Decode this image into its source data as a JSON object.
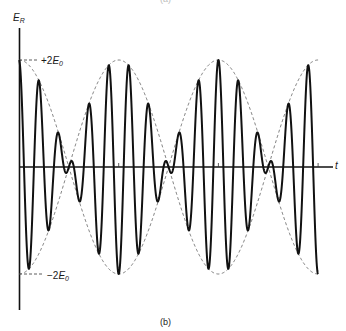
{
  "figure": {
    "top_caption": "(a)",
    "caption": "(b)",
    "y_axis_label": {
      "symbol": "E",
      "subscript": "R"
    },
    "x_axis_label": "t",
    "upper_level_label": {
      "prefix": "+2",
      "symbol": "E",
      "subscript": "0"
    },
    "lower_level_label": {
      "prefix": "−2",
      "symbol": "E",
      "subscript": "0"
    },
    "colors": {
      "waveform": "#111111",
      "envelope": "#555555",
      "axis": "#111111",
      "background": "#ffffff"
    }
  },
  "chart_data": {
    "type": "line",
    "xlabel": "t",
    "ylabel": "E_R",
    "y_reference_levels": [
      {
        "label": "+2E0",
        "value": 2
      },
      {
        "label": "-2E0",
        "value": -2
      }
    ],
    "ylim": [
      -2,
      2
    ],
    "grid": false,
    "legend": null,
    "series": [
      {
        "name": "resultant E_R",
        "style": "solid-thick",
        "formula": "2*cos(pi*t/T_beat)*cos(2*pi*t/T_carrier)"
      },
      {
        "name": "envelope +",
        "style": "dashed",
        "formula": "+2*|cos(pi*t/T_beat)|"
      },
      {
        "name": "envelope -",
        "style": "dashed",
        "formula": "-2*|cos(pi*t/T_beat)|"
      }
    ],
    "params": {
      "T_beat_half": 100,
      "T_carrier": 20,
      "t_start": 0,
      "t_end": 300,
      "amplitude": 2
    },
    "envelope_peaks_t": [
      0,
      100,
      200,
      300
    ],
    "envelope_nodes_t": [
      50,
      150,
      250
    ],
    "x_tick_marks_t": [
      100,
      200,
      300
    ],
    "px": {
      "x0": 19,
      "y0": 167,
      "unit_x": 0.997,
      "amp_px": 107,
      "y_axis_top": 28,
      "y_axis_bottom": 310,
      "x_axis_end": 333
    }
  }
}
